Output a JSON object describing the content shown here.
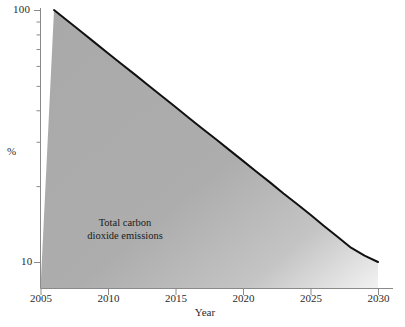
{
  "chart_data": {
    "type": "area",
    "title": "",
    "xlabel": "Year",
    "ylabel": "%",
    "yscale": "log",
    "ylim": [
      9,
      105
    ],
    "xlim": [
      2005,
      2030
    ],
    "grid": false,
    "legend": null,
    "annotations": [
      {
        "text_line1": "Total carbon",
        "text_line2": "dioxide emissions",
        "x": 2011.5,
        "y": 17
      }
    ],
    "x_ticks": [
      "2005",
      "2010",
      "2015",
      "2020",
      "2025",
      "2030"
    ],
    "x_tick_values": [
      2005,
      2010,
      2015,
      2020,
      2025,
      2030
    ],
    "y_ticks": [
      "100",
      "10"
    ],
    "y_tick_values": [
      100,
      10
    ],
    "y_minor_ticks": [
      90,
      80,
      70,
      60,
      50,
      40,
      30,
      20
    ],
    "series": [
      {
        "name": "Total carbon dioxide emissions",
        "x": [
          2006,
          2007,
          2008,
          2009,
          2010,
          2011,
          2012,
          2013,
          2014,
          2015,
          2016,
          2017,
          2018,
          2019,
          2020,
          2021,
          2022,
          2023,
          2024,
          2025,
          2026,
          2027,
          2028,
          2029,
          2030
        ],
        "values": [
          100,
          90.6,
          82.1,
          74.4,
          67.4,
          61.1,
          55.4,
          50.2,
          45.5,
          41.2,
          37.3,
          33.8,
          30.7,
          27.8,
          25.2,
          22.8,
          20.7,
          18.7,
          17.0,
          15.4,
          13.9,
          12.6,
          11.4,
          10.6,
          10.0
        ],
        "line_color": "#111111",
        "fill_color": "#adadad"
      }
    ]
  },
  "figure": {
    "background": "#ffffff",
    "axis_color": "#8a8a8a",
    "text_color": "#2b2b2b",
    "fill_color": "#adadad",
    "line_color": "#111111"
  }
}
